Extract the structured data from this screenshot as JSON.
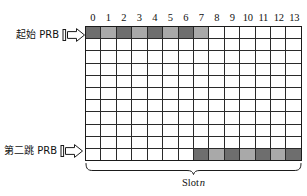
{
  "figure": {
    "colors": {
      "fill_dark": "#6e6e6e",
      "fill_light": "#a9a9a9",
      "grid_line": "#2a2a2a",
      "border": "#1b1b1b",
      "text": "#111111",
      "background": "#ffffff"
    }
  },
  "grid": {
    "column_headers": [
      "0",
      "1",
      "2",
      "3",
      "4",
      "5",
      "6",
      "7",
      "8",
      "9",
      "10",
      "11",
      "12",
      "13"
    ],
    "column_count": 14,
    "row_count": 11,
    "rows": [
      [
        "dark",
        "light",
        "dark",
        "light",
        "dark",
        "light",
        "dark",
        "light",
        "none",
        "none",
        "none",
        "none",
        "none",
        "none"
      ],
      [
        "none",
        "none",
        "none",
        "none",
        "none",
        "none",
        "none",
        "none",
        "none",
        "none",
        "none",
        "none",
        "none",
        "none"
      ],
      [
        "none",
        "none",
        "none",
        "none",
        "none",
        "none",
        "none",
        "none",
        "none",
        "none",
        "none",
        "none",
        "none",
        "none"
      ],
      [
        "none",
        "none",
        "none",
        "none",
        "none",
        "none",
        "none",
        "none",
        "none",
        "none",
        "none",
        "none",
        "none",
        "none"
      ],
      [
        "none",
        "none",
        "none",
        "none",
        "none",
        "none",
        "none",
        "none",
        "none",
        "none",
        "none",
        "none",
        "none",
        "none"
      ],
      [
        "none",
        "none",
        "none",
        "none",
        "none",
        "none",
        "none",
        "none",
        "none",
        "none",
        "none",
        "none",
        "none",
        "none"
      ],
      [
        "none",
        "none",
        "none",
        "none",
        "none",
        "none",
        "none",
        "none",
        "none",
        "none",
        "none",
        "none",
        "none",
        "none"
      ],
      [
        "none",
        "none",
        "none",
        "none",
        "none",
        "none",
        "none",
        "none",
        "none",
        "none",
        "none",
        "none",
        "none",
        "none"
      ],
      [
        "none",
        "none",
        "none",
        "none",
        "none",
        "none",
        "none",
        "none",
        "none",
        "none",
        "none",
        "none",
        "none",
        "none"
      ],
      [
        "none",
        "none",
        "none",
        "none",
        "none",
        "none",
        "none",
        "none",
        "none",
        "none",
        "none",
        "none",
        "none",
        "none"
      ],
      [
        "none",
        "none",
        "none",
        "none",
        "none",
        "none",
        "none",
        "dark",
        "light",
        "dark",
        "light",
        "dark",
        "light",
        "dark"
      ]
    ]
  },
  "labels": {
    "start_prb": "起始 PRB",
    "second_hop_prb": "第二跳 PRB"
  },
  "caption": {
    "slot_prefix": "Slot",
    "slot_index": "n"
  },
  "icons": {
    "start_arrow": "right-arrow-marker-icon",
    "second_hop_arrow": "right-arrow-marker-icon",
    "brace": "bottom-brace-icon"
  }
}
